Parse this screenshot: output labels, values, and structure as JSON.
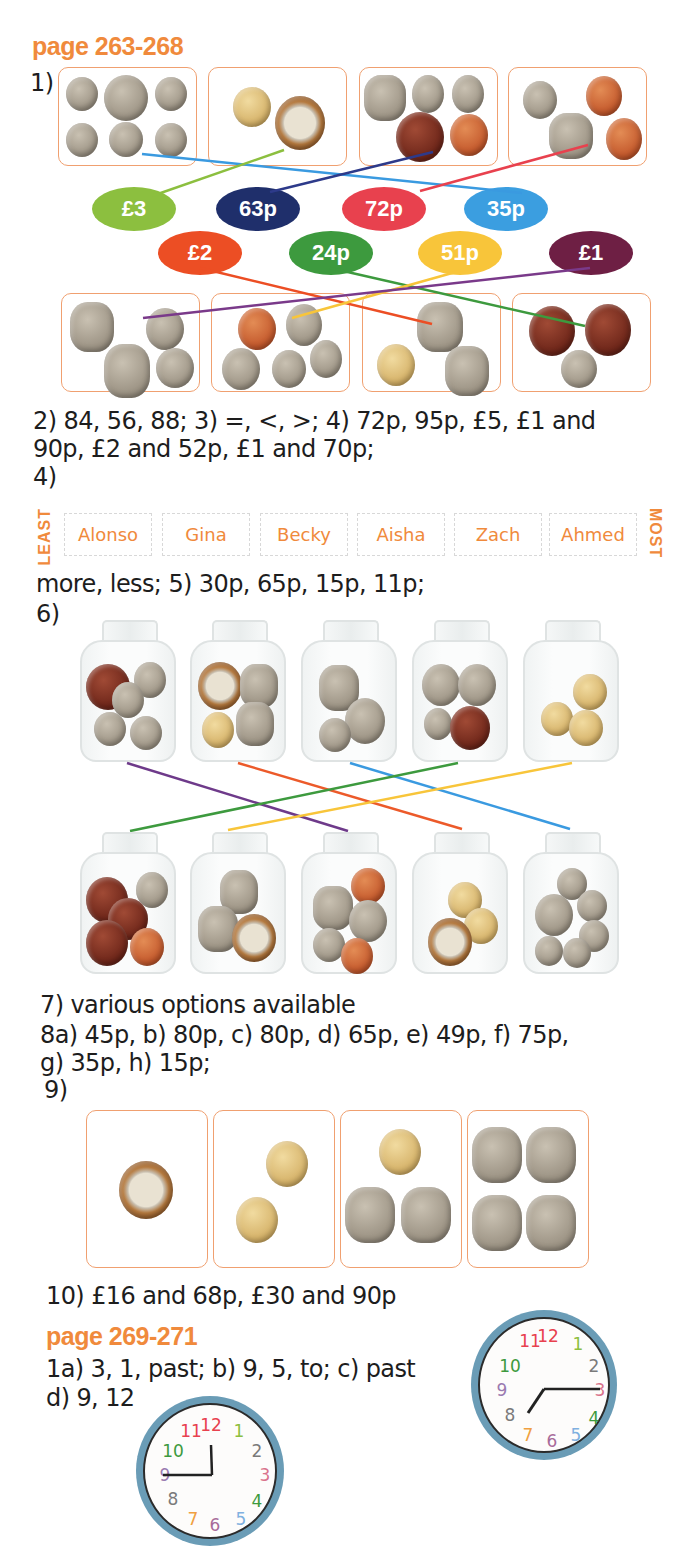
{
  "section1": {
    "heading": "page 263-268",
    "q1_label": "1)",
    "values_row1": [
      {
        "label": "£3",
        "color": "#8cbf3f"
      },
      {
        "label": "63p",
        "color": "#1f2f6b"
      },
      {
        "label": "72p",
        "color": "#e8414e"
      },
      {
        "label": "35p",
        "color": "#3b9ee0"
      }
    ],
    "values_row2": [
      {
        "label": "£2",
        "color": "#ec4e24"
      },
      {
        "label": "24p",
        "color": "#3d9a3e"
      },
      {
        "label": "51p",
        "color": "#f8c53a"
      },
      {
        "label": "£1",
        "color": "#6e1f44"
      }
    ],
    "answers_line1": "2) 84, 56, 88; 3) =, <, >; 4) 72p, 95p, £5, £1 and",
    "answers_line2": "90p, £2 and 52p, £1 and 70p;",
    "q4_label": "4)",
    "ordering": {
      "least_label": "LEAST",
      "most_label": "MOST",
      "names": [
        "Alonso",
        "Gina",
        "Becky",
        "Aisha",
        "Zach",
        "Ahmed"
      ]
    },
    "answers_line3": "more, less; 5) 30p, 65p, 15p, 11p;",
    "q6_label": "6)",
    "line_colors": {
      "purple": "#6e3a8a",
      "orange": "#ec5a2a",
      "blue": "#3a9ae0",
      "green": "#3d9a3e",
      "yellow": "#f8c53a"
    },
    "answers_line4": "7) various options available",
    "answers_line5": "8a) 45p, b) 80p, c) 80p, d) 65p, e) 49p, f) 75p,",
    "answers_line6": "g) 35p, h) 15p;",
    "q9_label": "9)",
    "answers_line7": "10) £16 and 68p, £30 and 90p"
  },
  "section2": {
    "heading": "page 269-271",
    "answers_line1": "1a) 3, 1, past; b) 9, 5, to; c) past",
    "answers_line2": "d) 9, 12",
    "clock_numbers": [
      {
        "n": "12",
        "color": "#e8414e"
      },
      {
        "n": "1",
        "color": "#8cbf3f"
      },
      {
        "n": "2",
        "color": "#7a7a7a"
      },
      {
        "n": "3",
        "color": "#d9738c"
      },
      {
        "n": "4",
        "color": "#3d9a3e"
      },
      {
        "n": "5",
        "color": "#7fb0e0"
      },
      {
        "n": "6",
        "color": "#a86b9a"
      },
      {
        "n": "7",
        "color": "#f0a040"
      },
      {
        "n": "8",
        "color": "#7a7a7a"
      },
      {
        "n": "9",
        "color": "#9a7ab0"
      },
      {
        "n": "10",
        "color": "#3d9a3e"
      },
      {
        "n": "11",
        "color": "#e8414e"
      }
    ]
  },
  "theme": {
    "accent_orange": "#f08a3c",
    "box_border": "#f0a070",
    "clock_rim": "#6a9cb6"
  }
}
